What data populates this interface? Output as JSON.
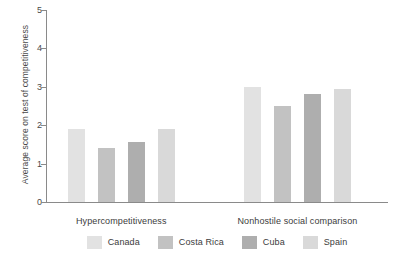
{
  "chart_data": {
    "type": "bar",
    "title": "",
    "xlabel": "",
    "ylabel": "Average score on test of competitiveness",
    "ylim": [
      0,
      5
    ],
    "yticks": [
      "0",
      "1",
      "2",
      "3",
      "4",
      "5"
    ],
    "grid": false,
    "legend_position": "bottom",
    "categories": [
      "Hypercompetitiveness",
      "Nonhostile social comparison"
    ],
    "series": [
      {
        "name": "Canada",
        "color": "#e2e2e2",
        "values": [
          1.9,
          3.0
        ]
      },
      {
        "name": "Costa Rica",
        "color": "#c2c2c2",
        "values": [
          1.4,
          2.5
        ]
      },
      {
        "name": "Cuba",
        "color": "#aeaeae",
        "values": [
          1.55,
          2.8
        ]
      },
      {
        "name": "Spain",
        "color": "#d9d9d9",
        "values": [
          1.9,
          2.95
        ]
      }
    ]
  },
  "axis": {
    "y_label": "Average score on test of competitiveness",
    "y_ticks": [
      "5",
      "4",
      "3",
      "2",
      "1",
      "0"
    ]
  },
  "groups": [
    {
      "label": "Hypercompetitiveness"
    },
    {
      "label": "Nonhostile social comparison"
    }
  ],
  "legend": {
    "items": [
      {
        "label": "Canada",
        "color": "#e2e2e2"
      },
      {
        "label": "Costa Rica",
        "color": "#c2c2c2"
      },
      {
        "label": "Cuba",
        "color": "#aeaeae"
      },
      {
        "label": "Spain",
        "color": "#d9d9d9"
      }
    ]
  }
}
